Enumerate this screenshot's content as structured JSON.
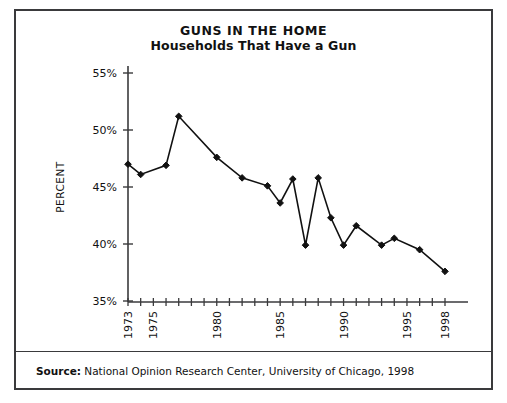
{
  "chart_data": {
    "type": "line",
    "title": "GUNS IN THE HOME",
    "subtitle": "Households That Have a Gun",
    "xlabel": "",
    "ylabel": "PERCENT",
    "ylim": [
      35,
      55
    ],
    "ytick_labels": [
      "55%",
      "50%",
      "45%",
      "40%",
      "35%"
    ],
    "ytick_values": [
      55,
      50,
      45,
      40,
      35
    ],
    "xlim": [
      1973,
      1998
    ],
    "xtick_labels": [
      "1973",
      "1975",
      "1980",
      "1985",
      "1990",
      "1995",
      "1998"
    ],
    "xtick_values": [
      1973,
      1975,
      1980,
      1985,
      1990,
      1995,
      1998
    ],
    "grid": false,
    "legend": "none",
    "marker": "diamond",
    "line_color": "#111111",
    "marker_color": "#111111",
    "x": [
      1973,
      1974,
      1976,
      1977,
      1980,
      1982,
      1984,
      1985,
      1986,
      1987,
      1988,
      1989,
      1990,
      1991,
      1993,
      1994,
      1996,
      1998
    ],
    "values": [
      47.0,
      46.1,
      46.9,
      51.2,
      47.6,
      45.8,
      45.1,
      43.6,
      45.7,
      39.9,
      45.8,
      42.3,
      39.9,
      41.6,
      39.9,
      40.5,
      39.5,
      37.6
    ],
    "points": [
      {
        "year": 1973,
        "value": 47.0
      },
      {
        "year": 1974,
        "value": 46.1
      },
      {
        "year": 1976,
        "value": 46.9
      },
      {
        "year": 1977,
        "value": 51.2
      },
      {
        "year": 1980,
        "value": 47.6
      },
      {
        "year": 1982,
        "value": 45.8
      },
      {
        "year": 1984,
        "value": 45.1
      },
      {
        "year": 1985,
        "value": 43.6
      },
      {
        "year": 1986,
        "value": 45.7
      },
      {
        "year": 1987,
        "value": 39.9
      },
      {
        "year": 1988,
        "value": 45.8
      },
      {
        "year": 1989,
        "value": 42.3
      },
      {
        "year": 1990,
        "value": 39.9
      },
      {
        "year": 1991,
        "value": 41.6
      },
      {
        "year": 1993,
        "value": 39.9
      },
      {
        "year": 1994,
        "value": 40.5
      },
      {
        "year": 1996,
        "value": 39.5
      },
      {
        "year": 1998,
        "value": 37.6
      }
    ]
  },
  "source": {
    "label": "Source:",
    "text": "National Opinion Research Center, University of Chicago, 1998"
  }
}
